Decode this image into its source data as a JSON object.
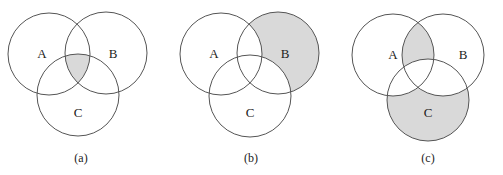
{
  "figure": {
    "shade_color": "#d9d9d9",
    "stroke_color": "#555555",
    "diagrams": [
      {
        "caption": "(a)",
        "labels": {
          "A": "A",
          "B": "B",
          "C": "C"
        },
        "shaded_region": "A ∩ B ∩ C"
      },
      {
        "caption": "(b)",
        "labels": {
          "A": "A",
          "B": "B",
          "C": "C"
        },
        "shaded_region": "B − (A ∪ C)"
      },
      {
        "caption": "(c)",
        "labels": {
          "A": "A",
          "B": "B",
          "C": "C"
        },
        "shaded_region": "(A ∩ B − C) ∪ (C − (A ∪ B))"
      }
    ]
  }
}
